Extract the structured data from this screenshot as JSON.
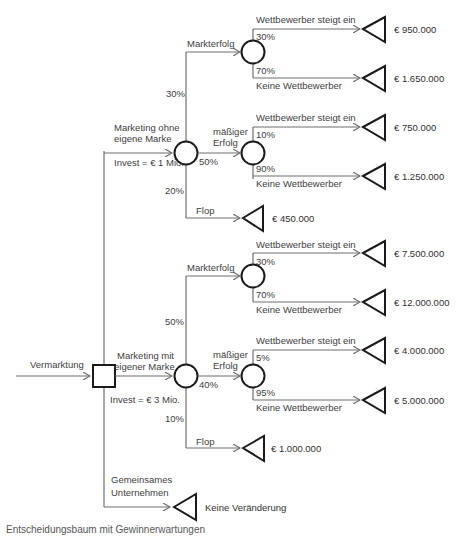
{
  "diagram": {
    "type": "decision-tree",
    "root": {
      "incoming_label": "Vermarktung",
      "node_type": "decision"
    },
    "alternatives": [
      {
        "label_line1": "Marketing ohne",
        "label_line2": "eigene Marke",
        "invest": "Invest = € 1 Mio.",
        "outcomes": [
          {
            "label": "Markterfolg",
            "probability": "30%",
            "sub": [
              {
                "label": "Wettbewerber steigt ein",
                "probability": "30%",
                "value": "€ 950.000"
              },
              {
                "label": "Keine Wettbewerber",
                "probability": "70%",
                "value": "€ 1.650.000"
              }
            ]
          },
          {
            "label_line1": "mäßiger",
            "label_line2": "Erfolg",
            "probability": "50%",
            "sub": [
              {
                "label": "Wettbewerber steigt ein",
                "probability": "10%",
                "value": "€ 750.000"
              },
              {
                "label": "Keine Wettbewerber",
                "probability": "90%",
                "value": "€ 1.250.000"
              }
            ]
          },
          {
            "label": "Flop",
            "probability": "20%",
            "value": "€ 450.000"
          }
        ]
      },
      {
        "label_line1": "Marketing  mit",
        "label_line2": "eigener Marke",
        "invest": "Invest = € 3 Mio.",
        "outcomes": [
          {
            "label": "Markterfolg",
            "probability": "50%",
            "sub": [
              {
                "label": "Wettbewerber steigt ein",
                "probability": "30%",
                "value": "€ 7.500.000"
              },
              {
                "label": "Keine Wettbewerber",
                "probability": "70%",
                "value": "€ 12.000.000"
              }
            ]
          },
          {
            "label_line1": "mäßiger",
            "label_line2": "Erfolg",
            "probability": "40%",
            "sub": [
              {
                "label": "Wettbewerber steigt ein",
                "probability": "5%",
                "value": "€ 4.000.000"
              },
              {
                "label": "Keine Wettbewerber",
                "probability": "95%",
                "value": "€ 5.000.000"
              }
            ]
          },
          {
            "label": "Flop",
            "probability": "10%",
            "value": "€ 1.000.000"
          }
        ]
      },
      {
        "label_line1": "Gemeinsames",
        "label_line2": "Unternehmen",
        "value": "Keine Veränderung"
      }
    ],
    "caption": "Entscheidungsbaum mit Gewinnerwartungen"
  },
  "colors": {
    "line": "#6e6e6e",
    "shape_stroke": "#1a1a1a",
    "text": "#404040",
    "background": "#ffffff"
  }
}
